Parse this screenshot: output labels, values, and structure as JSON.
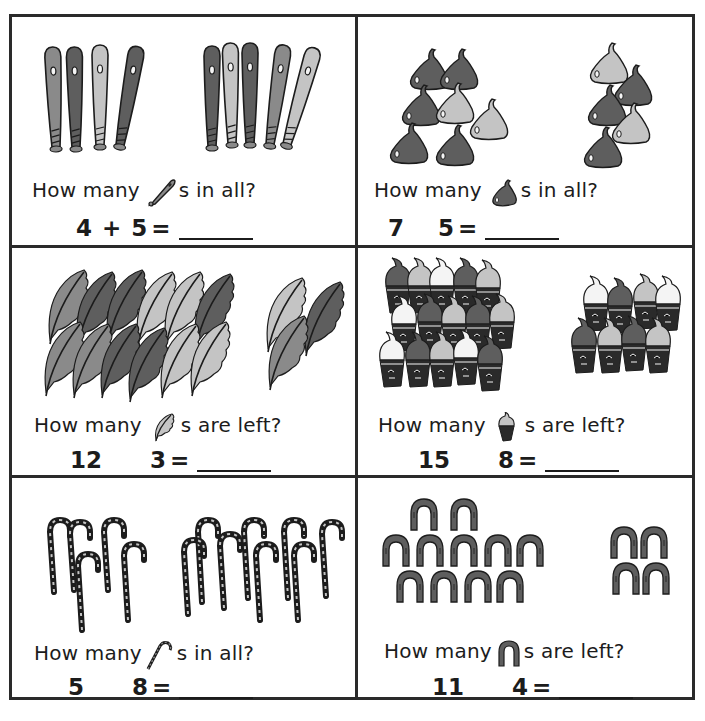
{
  "worksheet": {
    "colors": {
      "ink": "#1c1c1c",
      "dark": "#5e5e5e",
      "mid": "#8a8a8a",
      "light": "#c4c4c4",
      "white": "#f4f4f4"
    },
    "panels": [
      {
        "id": "bats",
        "question_prefix": "How many",
        "question_suffix": "s in all?",
        "icon": "baseball-bat-icon",
        "number_a": "4",
        "operator": "+",
        "number_b": "5",
        "equals": "=",
        "group_a_count": 4,
        "group_b_count": 5
      },
      {
        "id": "chocolate-drops",
        "question_prefix": "How many",
        "question_suffix": "s in all?",
        "icon": "chocolate-drop-icon",
        "number_a": "7",
        "operator": "",
        "number_b": "5",
        "equals": "=",
        "group_a_count": 7,
        "group_b_count": 5
      },
      {
        "id": "feathers",
        "question_prefix": "How many",
        "question_suffix": "s are left?",
        "icon": "feather-icon",
        "number_a": "12",
        "operator": "",
        "number_b": "3",
        "equals": "=",
        "group_a_count": 12,
        "group_b_count": 3
      },
      {
        "id": "ice-cream-cones",
        "question_prefix": "How many",
        "question_suffix": "s are left?",
        "icon": "ice-cream-cone-icon",
        "number_a": "15",
        "operator": "",
        "number_b": "8",
        "equals": "=",
        "group_a_count": 15,
        "group_b_count": 8
      },
      {
        "id": "candy-canes",
        "question_prefix": "How many",
        "question_suffix": "s in all?",
        "icon": "candy-cane-icon",
        "number_a": "5",
        "operator": "",
        "number_b": "8",
        "equals": "=",
        "group_a_count": 5,
        "group_b_count": 8
      },
      {
        "id": "horseshoes",
        "question_prefix": "How many",
        "question_suffix": "s are left?",
        "icon": "horseshoe-icon",
        "number_a": "11",
        "operator": "",
        "number_b": "4",
        "equals": "=",
        "group_a_count": 11,
        "group_b_count": 4
      }
    ]
  }
}
